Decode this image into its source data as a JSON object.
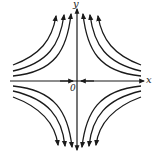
{
  "diagram": {
    "type": "phase-portrait",
    "axes": {
      "x_label": "x",
      "y_label": "y",
      "origin_label": "0"
    },
    "stroke_color": "#1a1a1a",
    "background_color": "#ffffff",
    "curves_per_quadrant": 3,
    "quadrants": [
      {
        "name": "top-left",
        "direction": "toward +y (upward)"
      },
      {
        "name": "top-right",
        "direction": "toward +y (upward)"
      },
      {
        "name": "bottom-left",
        "direction": "toward -y (downward)"
      },
      {
        "name": "bottom-right",
        "direction": "toward -y (downward)"
      }
    ],
    "axis_flow": {
      "x_axis": "inward toward origin",
      "y_axis": "outward from origin"
    }
  }
}
